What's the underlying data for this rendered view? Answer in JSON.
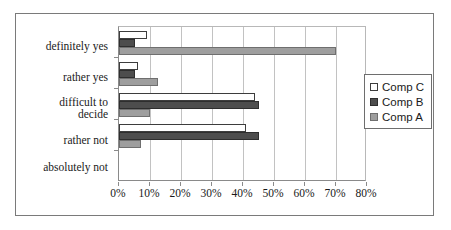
{
  "chart_data": {
    "type": "bar",
    "orientation": "horizontal",
    "title": "",
    "xlabel": "",
    "ylabel": "",
    "xlim": [
      0,
      80
    ],
    "xtick_labels": [
      "0%",
      "10%",
      "20%",
      "30%",
      "40%",
      "50%",
      "60%",
      "70%",
      "80%"
    ],
    "xtick_values": [
      0,
      10,
      20,
      30,
      40,
      50,
      60,
      70,
      80
    ],
    "grid": true,
    "legend_position": "right",
    "categories": [
      "definitely yes",
      "rather yes",
      "difficult to decide",
      "rather not",
      "absolutely not"
    ],
    "series": [
      {
        "name": "Comp C",
        "color": "#ffffff",
        "values": [
          9,
          6,
          44,
          41,
          0
        ]
      },
      {
        "name": "Comp B",
        "color": "#4d4d4d",
        "values": [
          5,
          5,
          45,
          45,
          0
        ]
      },
      {
        "name": "Comp A",
        "color": "#9e9e9e",
        "values": [
          70,
          12.5,
          10,
          7,
          0
        ]
      }
    ]
  },
  "legend": {
    "items": [
      {
        "label": "Comp C",
        "swatch": "white-square-icon"
      },
      {
        "label": "Comp B",
        "swatch": "dark-gray-square-icon"
      },
      {
        "label": "Comp A",
        "swatch": "medium-gray-square-icon"
      }
    ]
  }
}
